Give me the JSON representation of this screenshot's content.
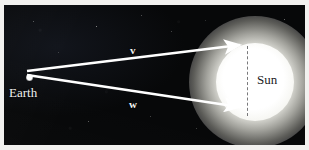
{
  "figure": {
    "kind": "astronomy-vector-diagram",
    "width": 309,
    "height": 150,
    "background_color": "#0a0a0c",
    "margin_color": "#f2f1ef"
  },
  "labels": {
    "earth": "Earth",
    "sun": "Sun",
    "vector_v": "v",
    "vector_w": "w"
  },
  "bodies": {
    "earth": {
      "name": "Earth",
      "center_x": 25,
      "center_y": 72,
      "radius": 3,
      "color": "#ffffff"
    },
    "sun": {
      "name": "Sun",
      "center_x": 251,
      "center_y": 77,
      "core_radius": 39,
      "glow_radius": 66,
      "color": "#ffffff",
      "label_color": "#1b1b1d"
    }
  },
  "vectors": [
    {
      "name": "v",
      "label": "v",
      "from_x": 27,
      "from_y": 71,
      "to_x": 243,
      "to_y": 45,
      "color": "#ffffff",
      "label_x": 128,
      "label_y": 44
    },
    {
      "name": "w",
      "label": "w",
      "from_x": 27,
      "from_y": 75,
      "to_x": 243,
      "to_y": 107,
      "color": "#ffffff",
      "label_x": 127,
      "label_y": 98
    }
  ],
  "guides": [
    {
      "name": "sun-diameter",
      "style": "dashed",
      "x": 243,
      "y_top": 41,
      "y_bottom": 111,
      "color": "#6e6e70"
    }
  ],
  "stars": [
    {
      "x": 33,
      "y": 21,
      "size": 1.0,
      "opacity": 0.45
    },
    {
      "x": 96,
      "y": 26,
      "size": 1.4,
      "opacity": 0.7
    },
    {
      "x": 141,
      "y": 15,
      "size": 1.0,
      "opacity": 0.4
    },
    {
      "x": 171,
      "y": 31,
      "size": 1.0,
      "opacity": 0.35
    },
    {
      "x": 58,
      "y": 52,
      "size": 1.0,
      "opacity": 0.3
    },
    {
      "x": 88,
      "y": 121,
      "size": 1.2,
      "opacity": 0.5
    },
    {
      "x": 150,
      "y": 116,
      "size": 1.0,
      "opacity": 0.35
    },
    {
      "x": 196,
      "y": 128,
      "size": 1.0,
      "opacity": 0.32
    },
    {
      "x": 284,
      "y": 19,
      "size": 1.3,
      "opacity": 0.55
    },
    {
      "x": 262,
      "y": 136,
      "size": 1.0,
      "opacity": 0.3
    },
    {
      "x": 118,
      "y": 60,
      "size": 0.9,
      "opacity": 0.25
    },
    {
      "x": 205,
      "y": 20,
      "size": 0.9,
      "opacity": 0.28
    }
  ]
}
